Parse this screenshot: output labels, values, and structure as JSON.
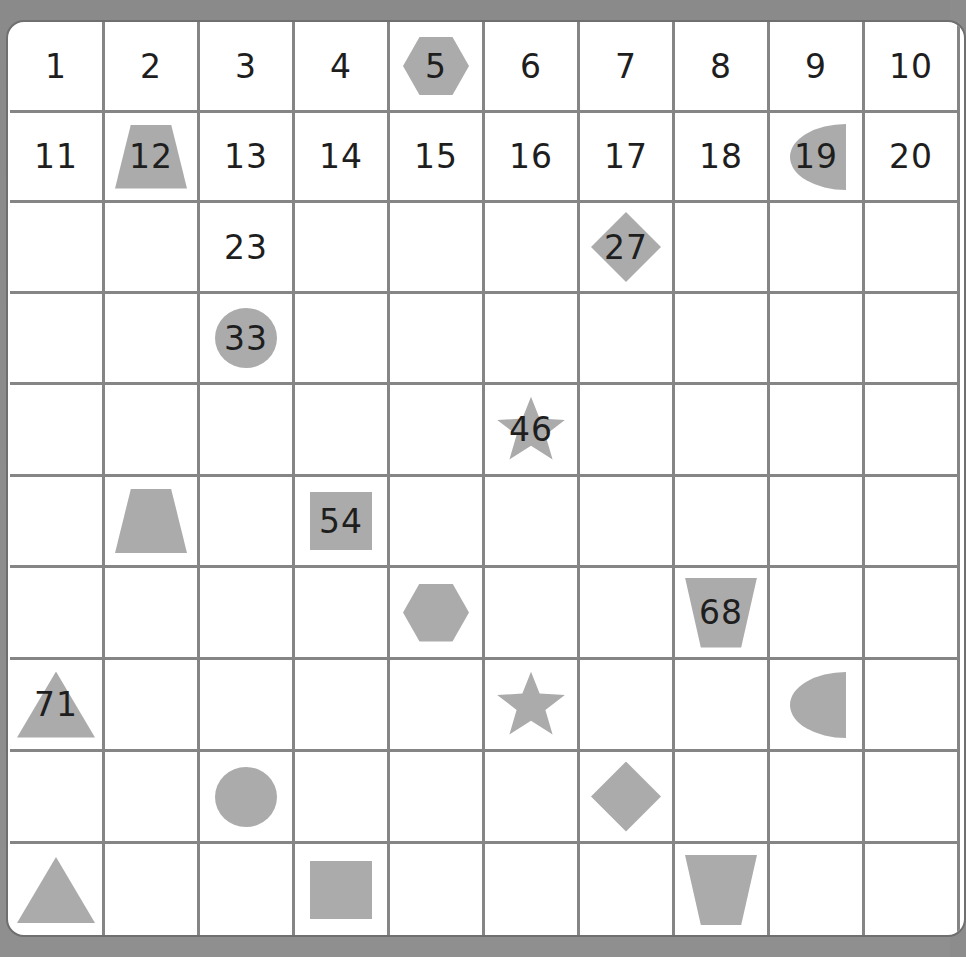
{
  "board": {
    "title": "Hundred chart with shape pattern",
    "rows": 10,
    "columns": 10,
    "colors": {
      "frame": "#8c8c8c",
      "board": "#ffffff",
      "gridline": "#858585",
      "shape_fill": "#ababab",
      "number_text": "#1e1e1e"
    },
    "cells": [
      {
        "id": 1,
        "label": "1",
        "shape": ""
      },
      {
        "id": 2,
        "label": "2",
        "shape": ""
      },
      {
        "id": 3,
        "label": "3",
        "shape": ""
      },
      {
        "id": 4,
        "label": "4",
        "shape": ""
      },
      {
        "id": 5,
        "label": "5",
        "shape": "hexagon"
      },
      {
        "id": 6,
        "label": "6",
        "shape": ""
      },
      {
        "id": 7,
        "label": "7",
        "shape": ""
      },
      {
        "id": 8,
        "label": "8",
        "shape": ""
      },
      {
        "id": 9,
        "label": "9",
        "shape": ""
      },
      {
        "id": 10,
        "label": "10",
        "shape": ""
      },
      {
        "id": 11,
        "label": "11",
        "shape": ""
      },
      {
        "id": 12,
        "label": "12",
        "shape": "trapezoid"
      },
      {
        "id": 13,
        "label": "13",
        "shape": ""
      },
      {
        "id": 14,
        "label": "14",
        "shape": ""
      },
      {
        "id": 15,
        "label": "15",
        "shape": ""
      },
      {
        "id": 16,
        "label": "16",
        "shape": ""
      },
      {
        "id": 17,
        "label": "17",
        "shape": ""
      },
      {
        "id": 18,
        "label": "18",
        "shape": ""
      },
      {
        "id": 19,
        "label": "19",
        "shape": "halfcircle"
      },
      {
        "id": 20,
        "label": "20",
        "shape": ""
      },
      {
        "id": 21,
        "label": "",
        "shape": ""
      },
      {
        "id": 22,
        "label": "",
        "shape": ""
      },
      {
        "id": 23,
        "label": "23",
        "shape": ""
      },
      {
        "id": 24,
        "label": "",
        "shape": ""
      },
      {
        "id": 25,
        "label": "",
        "shape": ""
      },
      {
        "id": 26,
        "label": "",
        "shape": ""
      },
      {
        "id": 27,
        "label": "27",
        "shape": "diamond"
      },
      {
        "id": 28,
        "label": "",
        "shape": ""
      },
      {
        "id": 29,
        "label": "",
        "shape": ""
      },
      {
        "id": 30,
        "label": "",
        "shape": ""
      },
      {
        "id": 31,
        "label": "",
        "shape": ""
      },
      {
        "id": 32,
        "label": "",
        "shape": ""
      },
      {
        "id": 33,
        "label": "33",
        "shape": "circle"
      },
      {
        "id": 34,
        "label": "",
        "shape": ""
      },
      {
        "id": 35,
        "label": "",
        "shape": ""
      },
      {
        "id": 36,
        "label": "",
        "shape": ""
      },
      {
        "id": 37,
        "label": "",
        "shape": ""
      },
      {
        "id": 38,
        "label": "",
        "shape": ""
      },
      {
        "id": 39,
        "label": "",
        "shape": ""
      },
      {
        "id": 40,
        "label": "",
        "shape": ""
      },
      {
        "id": 41,
        "label": "",
        "shape": ""
      },
      {
        "id": 42,
        "label": "",
        "shape": ""
      },
      {
        "id": 43,
        "label": "",
        "shape": ""
      },
      {
        "id": 44,
        "label": "",
        "shape": ""
      },
      {
        "id": 45,
        "label": "",
        "shape": ""
      },
      {
        "id": 46,
        "label": "46",
        "shape": "star"
      },
      {
        "id": 47,
        "label": "",
        "shape": ""
      },
      {
        "id": 48,
        "label": "",
        "shape": ""
      },
      {
        "id": 49,
        "label": "",
        "shape": ""
      },
      {
        "id": 50,
        "label": "",
        "shape": ""
      },
      {
        "id": 51,
        "label": "",
        "shape": ""
      },
      {
        "id": 52,
        "label": "",
        "shape": "trapezoid"
      },
      {
        "id": 53,
        "label": "",
        "shape": ""
      },
      {
        "id": 54,
        "label": "54",
        "shape": "square"
      },
      {
        "id": 55,
        "label": "",
        "shape": ""
      },
      {
        "id": 56,
        "label": "",
        "shape": ""
      },
      {
        "id": 57,
        "label": "",
        "shape": ""
      },
      {
        "id": 58,
        "label": "",
        "shape": ""
      },
      {
        "id": 59,
        "label": "",
        "shape": ""
      },
      {
        "id": 60,
        "label": "",
        "shape": ""
      },
      {
        "id": 61,
        "label": "",
        "shape": ""
      },
      {
        "id": 62,
        "label": "",
        "shape": ""
      },
      {
        "id": 63,
        "label": "",
        "shape": ""
      },
      {
        "id": 64,
        "label": "",
        "shape": ""
      },
      {
        "id": 65,
        "label": "",
        "shape": "hexagon"
      },
      {
        "id": 66,
        "label": "",
        "shape": ""
      },
      {
        "id": 67,
        "label": "",
        "shape": ""
      },
      {
        "id": 68,
        "label": "68",
        "shape": "inv-trapezoid"
      },
      {
        "id": 69,
        "label": "",
        "shape": ""
      },
      {
        "id": 70,
        "label": "",
        "shape": ""
      },
      {
        "id": 71,
        "label": "71",
        "shape": "triangle"
      },
      {
        "id": 72,
        "label": "",
        "shape": ""
      },
      {
        "id": 73,
        "label": "",
        "shape": ""
      },
      {
        "id": 74,
        "label": "",
        "shape": ""
      },
      {
        "id": 75,
        "label": "",
        "shape": ""
      },
      {
        "id": 76,
        "label": "",
        "shape": "star"
      },
      {
        "id": 77,
        "label": "",
        "shape": ""
      },
      {
        "id": 78,
        "label": "",
        "shape": ""
      },
      {
        "id": 79,
        "label": "",
        "shape": "halfcircle"
      },
      {
        "id": 80,
        "label": "",
        "shape": ""
      },
      {
        "id": 81,
        "label": "",
        "shape": ""
      },
      {
        "id": 82,
        "label": "",
        "shape": ""
      },
      {
        "id": 83,
        "label": "",
        "shape": "circle"
      },
      {
        "id": 84,
        "label": "",
        "shape": ""
      },
      {
        "id": 85,
        "label": "",
        "shape": ""
      },
      {
        "id": 86,
        "label": "",
        "shape": ""
      },
      {
        "id": 87,
        "label": "",
        "shape": "diamond"
      },
      {
        "id": 88,
        "label": "",
        "shape": ""
      },
      {
        "id": 89,
        "label": "",
        "shape": ""
      },
      {
        "id": 90,
        "label": "",
        "shape": ""
      },
      {
        "id": 91,
        "label": "",
        "shape": "triangle"
      },
      {
        "id": 92,
        "label": "",
        "shape": ""
      },
      {
        "id": 93,
        "label": "",
        "shape": ""
      },
      {
        "id": 94,
        "label": "",
        "shape": "square"
      },
      {
        "id": 95,
        "label": "",
        "shape": ""
      },
      {
        "id": 96,
        "label": "",
        "shape": ""
      },
      {
        "id": 97,
        "label": "",
        "shape": ""
      },
      {
        "id": 98,
        "label": "",
        "shape": "inv-trapezoid"
      },
      {
        "id": 99,
        "label": "",
        "shape": ""
      },
      {
        "id": 100,
        "label": "",
        "shape": ""
      }
    ]
  }
}
